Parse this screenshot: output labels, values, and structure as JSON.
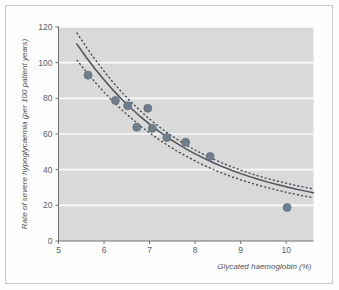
{
  "figure": {
    "background_color": "#fdfdfd",
    "frame_color": "#c9c9c9"
  },
  "chart_data": {
    "type": "scatter",
    "title": "",
    "subtitle": "",
    "xlabel": "Glycated haemoglobin (%)",
    "ylabel": "Rate of severe hypoglycaemia (per 100 patient years)",
    "xlim": [
      5,
      10.6
    ],
    "ylim": [
      0,
      120
    ],
    "xticks": [
      5,
      6,
      7,
      8,
      9,
      10
    ],
    "xtick_labels": [
      "5",
      "6",
      "7",
      "8",
      "9",
      "10"
    ],
    "yticks": [
      0,
      20,
      40,
      60,
      80,
      100,
      120
    ],
    "ytick_labels": [
      "0",
      "20",
      "40",
      "60",
      "80",
      "100",
      "120"
    ],
    "grid": "horizontal-white",
    "plot_background_color": "#d9d9d9",
    "gridline_color": "#fbfbfb",
    "legend": "none",
    "legend_position": "none",
    "annotations": [],
    "marker_color": "#6f7d8c",
    "marker_edge_color": "#5d6a78",
    "curve_color": "#4d535a",
    "ci_color": "#3f444a",
    "points": [
      {
        "x": 5.65,
        "y": 93.0
      },
      {
        "x": 6.25,
        "y": 78.8
      },
      {
        "x": 6.52,
        "y": 75.8
      },
      {
        "x": 6.72,
        "y": 63.8
      },
      {
        "x": 6.96,
        "y": 74.4
      },
      {
        "x": 7.06,
        "y": 63.2
      },
      {
        "x": 7.38,
        "y": 58.0
      },
      {
        "x": 7.79,
        "y": 55.4
      },
      {
        "x": 8.33,
        "y": 47.4
      },
      {
        "x": 10.02,
        "y": 18.8
      }
    ],
    "series": [
      {
        "name": "Fitted curve",
        "style": "solid",
        "x": [
          5.4,
          5.6,
          5.8,
          6.0,
          6.2,
          6.4,
          6.6,
          6.8,
          7.0,
          7.2,
          7.4,
          7.6,
          7.8,
          8.0,
          8.2,
          8.4,
          8.6,
          8.8,
          9.0,
          9.2,
          9.4,
          9.6,
          9.8,
          10.0,
          10.2,
          10.4,
          10.6
        ],
        "values": [
          110.5,
          103.3,
          96.6,
          90.4,
          84.6,
          79.2,
          74.3,
          69.7,
          65.5,
          61.6,
          58.0,
          54.7,
          51.7,
          48.9,
          46.3,
          43.9,
          41.7,
          39.7,
          37.8,
          36.1,
          34.5,
          33.0,
          31.7,
          30.4,
          29.2,
          28.1,
          27.1
        ]
      },
      {
        "name": "Upper 95% CI",
        "style": "dashed",
        "x": [
          5.4,
          5.6,
          5.8,
          6.0,
          6.2,
          6.4,
          6.6,
          6.8,
          7.0,
          7.2,
          7.4,
          7.6,
          7.8,
          8.0,
          8.2,
          8.4,
          8.6,
          8.8,
          9.0,
          9.2,
          9.4,
          9.6,
          9.8,
          10.0,
          10.2,
          10.4,
          10.6
        ],
        "values": [
          116.8,
          109.1,
          101.9,
          95.2,
          88.9,
          83.1,
          77.8,
          72.9,
          68.4,
          64.3,
          60.5,
          57.1,
          53.9,
          51.0,
          48.4,
          45.9,
          43.7,
          41.6,
          39.7,
          38.0,
          36.4,
          34.9,
          33.6,
          32.4,
          31.2,
          30.2,
          29.2
        ]
      },
      {
        "name": "Lower 95% CI",
        "style": "dashed",
        "x": [
          5.4,
          5.6,
          5.8,
          6.0,
          6.2,
          6.4,
          6.6,
          6.8,
          7.0,
          7.2,
          7.4,
          7.6,
          7.8,
          8.0,
          8.2,
          8.4,
          8.6,
          8.8,
          9.0,
          9.2,
          9.4,
          9.6,
          9.8,
          10.0,
          10.2,
          10.4,
          10.6
        ],
        "values": [
          101.6,
          95.1,
          89.1,
          83.5,
          78.2,
          73.3,
          68.8,
          64.5,
          60.6,
          57.0,
          53.6,
          50.5,
          47.6,
          44.9,
          42.4,
          40.1,
          38.0,
          36.1,
          34.3,
          32.7,
          31.2,
          29.8,
          28.5,
          27.3,
          26.2,
          25.2,
          24.3
        ]
      }
    ]
  }
}
